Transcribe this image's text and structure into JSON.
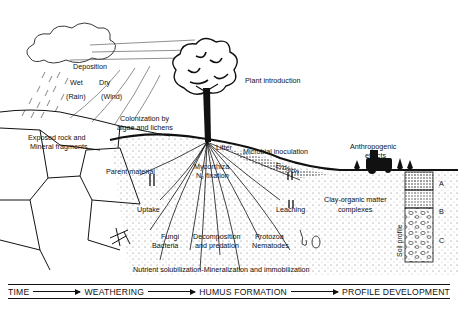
{
  "diagram": {
    "labels": {
      "deposition": "Deposition",
      "wet": "Wet",
      "rain": "(Rain)",
      "dry": "Dry",
      "wind": "(Wind)",
      "exposed_rock_1": "Exposed rock and",
      "exposed_rock_2": "Mineral fragments",
      "colonization_1": "Colonization by",
      "colonization_2": "algae and lichens",
      "plant_introduction": "Plant introduction",
      "parent_material": "Parent material",
      "litter": "Litter",
      "microbial_inoculation": "Microbial inoculation",
      "mycorrhiza": "Mycorrhiza",
      "n2_fixation": "N₂ fixation",
      "erosion": "Erosion",
      "anthropogenic_1": "Anthropogenic",
      "anthropogenic_2": "effects",
      "uptake": "Uptake",
      "leaching": "Leaching",
      "clay_organic_1": "Clay-organic matter",
      "clay_organic_2": "complexes",
      "fungi": "Fungi",
      "bacteria": "Bacteria",
      "decomposition_1": "Decomposition",
      "decomposition_2": "and predation",
      "protozoa": "Protozoa",
      "nematodes": "Nematodes",
      "nutrient": "Nutrient solubilization-Mineralization and immobilization",
      "soil_profile": "Soil profile",
      "horizon_a": "A",
      "horizon_b": "B",
      "horizon_c": "C"
    },
    "timeline": {
      "steps": [
        "TIME",
        "WEATHERING",
        "HUMUS FORMATION",
        "PROFILE DEVELOPMENT"
      ]
    }
  }
}
